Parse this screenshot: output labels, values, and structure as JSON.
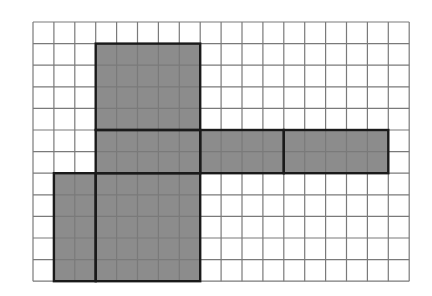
{
  "figure": {
    "grid": {
      "cols": 18,
      "rows": 12,
      "origin_x": 33,
      "origin_y": 22,
      "cell_w": 20.9,
      "cell_h": 21.6,
      "line_color": "#7a7a7a",
      "background": "#ffffff"
    },
    "fill_color": "#8c8c8c",
    "outline_color": "#1a1a1a",
    "faces": [
      {
        "name": "top-face",
        "col": 3,
        "row": 1,
        "w": 5,
        "h": 4
      },
      {
        "name": "front-face",
        "col": 3,
        "row": 5,
        "w": 5,
        "h": 2
      },
      {
        "name": "right-side-face",
        "col": 8,
        "row": 5,
        "w": 4,
        "h": 2
      },
      {
        "name": "back-face",
        "col": 12,
        "row": 5,
        "w": 5,
        "h": 2
      },
      {
        "name": "left-side-face",
        "col": 1,
        "row": 7,
        "w": 2,
        "h": 5
      },
      {
        "name": "bottom-face",
        "col": 3,
        "row": 7,
        "w": 5,
        "h": 5
      }
    ]
  }
}
